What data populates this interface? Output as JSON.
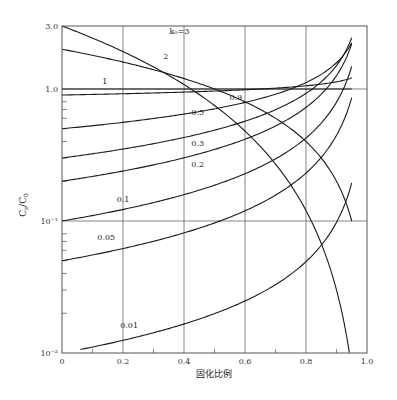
{
  "chart_data": {
    "type": "line",
    "title": "",
    "xlabel": "固化比例",
    "ylabel": "C_s/C_0",
    "ylabel_main": "C",
    "ylabel_sub1": "s",
    "ylabel_sep": "/C",
    "ylabel_sub2": "0",
    "xscale": "linear",
    "yscale": "log",
    "xlim": [
      0,
      1.0
    ],
    "ylim": [
      0.01,
      3.0
    ],
    "grid": true,
    "x_ticks": [
      {
        "value": 0,
        "label": "0"
      },
      {
        "value": 0.2,
        "label": "0.2"
      },
      {
        "value": 0.4,
        "label": "0.4"
      },
      {
        "value": 0.6,
        "label": "0.6"
      },
      {
        "value": 0.8,
        "label": "0.8"
      },
      {
        "value": 1.0,
        "label": "1.0"
      }
    ],
    "x_minor_ticks": [
      0.1,
      0.3,
      0.5,
      0.7,
      0.9
    ],
    "y_ticks": [
      {
        "value": 3.0,
        "label": "3.0"
      },
      {
        "value": 1.0,
        "label": "1.0"
      },
      {
        "value": 0.1,
        "label": "10⁻¹"
      },
      {
        "value": 0.01,
        "label": "10⁻²"
      }
    ],
    "y_minor_ticks": [
      0.8,
      0.7,
      0.6,
      0.5,
      0.4,
      0.3,
      0.2,
      0.08,
      0.07,
      0.06,
      0.05,
      0.04,
      0.03,
      0.02
    ],
    "x_gridlines": [
      0.2,
      0.4,
      0.6,
      0.8
    ],
    "y_gridlines": [
      1.0,
      0.1
    ],
    "formula": "C_s/C_0 = k0 * (1 - f_s)^(k0 - 1)",
    "fs_max": 0.95,
    "series": [
      {
        "name": "k0=3",
        "k0": 3,
        "label": "k₀=3",
        "label_x": 0.385,
        "label_y": 2.6,
        "x": [
          0,
          0.2,
          0.4,
          0.6,
          0.8,
          0.95
        ],
        "values": [
          3.0,
          1.92,
          1.08,
          0.48,
          0.12,
          0.0075
        ]
      },
      {
        "name": "k0=2",
        "k0": 2,
        "label": "2",
        "label_x": 0.34,
        "label_y": 1.7,
        "x": [
          0,
          0.2,
          0.4,
          0.6,
          0.8,
          0.95
        ],
        "values": [
          2.0,
          1.6,
          1.2,
          0.8,
          0.4,
          0.1
        ]
      },
      {
        "name": "k0=1",
        "k0": 1,
        "label": "1",
        "label_x": 0.14,
        "label_y": 1.1,
        "x": [
          0,
          0.2,
          0.4,
          0.6,
          0.8,
          0.95
        ],
        "values": [
          1.0,
          1.0,
          1.0,
          1.0,
          1.0,
          1.0
        ]
      },
      {
        "name": "k0=0.9",
        "k0": 0.9,
        "label": "0.9",
        "label_x": 0.57,
        "label_y": 0.82,
        "x": [
          0,
          0.2,
          0.4,
          0.6,
          0.8,
          0.95
        ],
        "values": [
          0.9,
          0.92,
          0.95,
          0.99,
          1.06,
          1.22
        ]
      },
      {
        "name": "k0=0.5",
        "k0": 0.5,
        "label": "0.5",
        "label_x": 0.445,
        "label_y": 0.64,
        "x": [
          0,
          0.2,
          0.4,
          0.6,
          0.8,
          0.95
        ],
        "values": [
          0.5,
          0.56,
          0.65,
          0.79,
          1.12,
          2.24
        ]
      },
      {
        "name": "k0=0.3",
        "k0": 0.3,
        "label": "0.3",
        "label_x": 0.445,
        "label_y": 0.37,
        "x": [
          0,
          0.2,
          0.4,
          0.6,
          0.8,
          0.95
        ],
        "values": [
          0.3,
          0.35,
          0.43,
          0.57,
          0.93,
          2.46
        ]
      },
      {
        "name": "k0=0.2",
        "k0": 0.2,
        "label": "0.2",
        "label_x": 0.445,
        "label_y": 0.255,
        "x": [
          0,
          0.2,
          0.4,
          0.6,
          0.8,
          0.95
        ],
        "values": [
          0.2,
          0.24,
          0.3,
          0.42,
          0.72,
          2.19
        ]
      },
      {
        "name": "k0=0.1",
        "k0": 0.1,
        "label": "0.1",
        "label_x": 0.2,
        "label_y": 0.14,
        "x": [
          0,
          0.2,
          0.4,
          0.6,
          0.8,
          0.95
        ],
        "values": [
          0.1,
          0.122,
          0.158,
          0.228,
          0.426,
          1.49
        ]
      },
      {
        "name": "k0=0.05",
        "k0": 0.05,
        "label": "0.05",
        "label_x": 0.145,
        "label_y": 0.072,
        "x": [
          0,
          0.2,
          0.4,
          0.6,
          0.8,
          0.95
        ],
        "values": [
          0.05,
          0.062,
          0.081,
          0.119,
          0.231,
          0.86
        ]
      },
      {
        "name": "k0=0.01",
        "k0": 0.01,
        "label": "0.01",
        "label_x": 0.22,
        "label_y": 0.0155,
        "x": [
          0.06,
          0.2,
          0.4,
          0.6,
          0.8,
          0.95
        ],
        "values": [
          0.0106,
          0.0125,
          0.0166,
          0.0248,
          0.0493,
          0.193
        ]
      }
    ]
  }
}
